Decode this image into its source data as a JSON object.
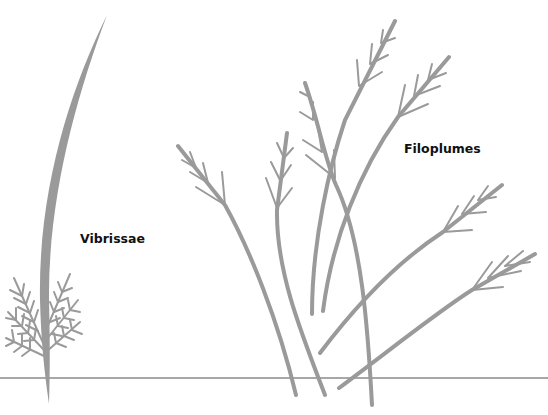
{
  "diagram": {
    "labels": {
      "vibrissae": "Vibrissae",
      "filoplumes": "Filoplumes"
    },
    "colors": {
      "feather": "#999999",
      "skin_line": "#8a8a8a",
      "label": "#111111",
      "background": "#ffffff"
    }
  }
}
